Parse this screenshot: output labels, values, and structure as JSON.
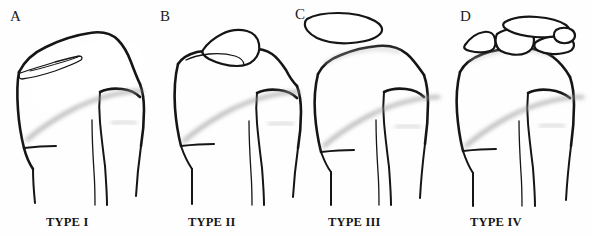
{
  "figure": {
    "background_color": "#fefefe",
    "ink_color": "#151515",
    "physis_color": "#9a9a9a",
    "style": "black-ink line drawing, medical classification figure"
  },
  "panels": [
    {
      "letter": "A",
      "caption": "TYPE I",
      "description": "Proximal tibia with thin undisplaced sliver fracture at the superomedial margin"
    },
    {
      "letter": "B",
      "caption": "TYPE II",
      "description": "Proximal tibia with a hinged fracture fragment displaced superiorly, still in contact"
    },
    {
      "letter": "C",
      "caption": "TYPE III",
      "description": "Proximal tibia with a completely separated displaced fragment above the joint surface"
    },
    {
      "letter": "D",
      "caption": "TYPE IV",
      "description": "Proximal tibia with comminuted multiple separated fragments above the joint surface"
    }
  ]
}
